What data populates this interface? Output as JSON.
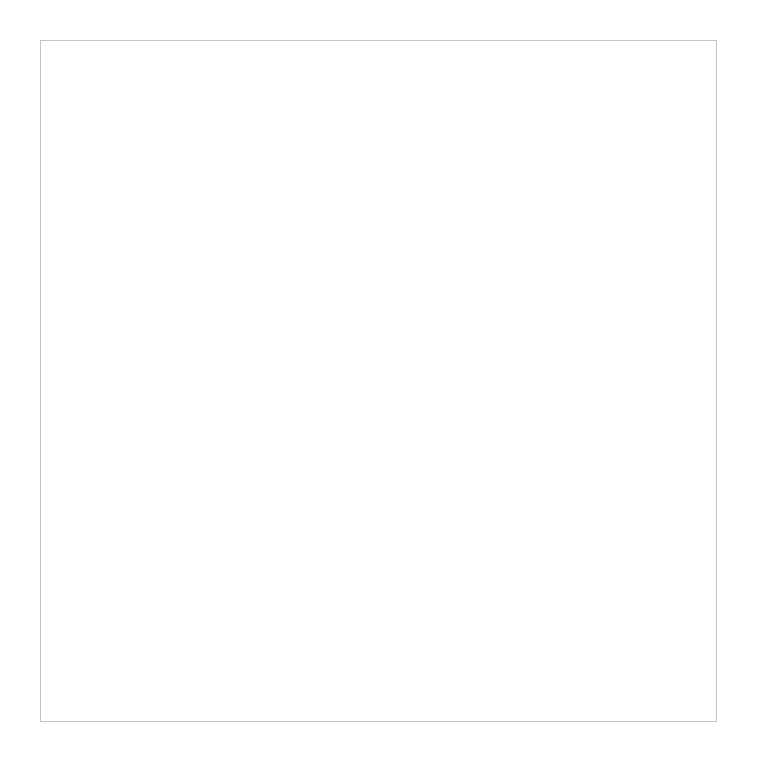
{
  "board": {
    "size": 25,
    "columns": [
      "a",
      "b",
      "c",
      "d",
      "e",
      "f",
      "g",
      "h",
      "i",
      "j",
      "k",
      "l",
      "m",
      "n",
      "o",
      "p",
      "q",
      "r",
      "s",
      "t",
      "u",
      "v",
      "w",
      "x",
      "y"
    ],
    "rows": [
      "1",
      "2",
      "3",
      "4",
      "5",
      "6",
      "7",
      "8",
      "9",
      "10",
      "11",
      "12",
      "13",
      "14",
      "15",
      "16",
      "17",
      "18",
      "19",
      "20",
      "21",
      "22",
      "23",
      "24",
      "25"
    ],
    "stones": [],
    "line_color": "#cfcfcf",
    "background": "#ffffff"
  }
}
